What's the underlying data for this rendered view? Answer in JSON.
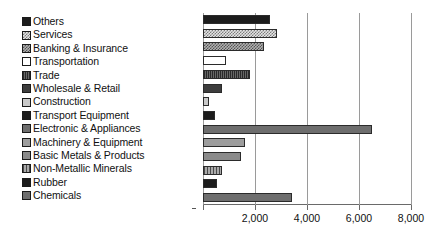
{
  "chart_data": {
    "type": "bar",
    "orientation": "horizontal",
    "title": "",
    "xlabel": "",
    "ylabel": "",
    "xlim": [
      0,
      8040
    ],
    "xticks": [
      2000,
      4000,
      6000,
      8000
    ],
    "xtick_labels": [
      "2,000",
      "4,000",
      "6,000",
      "8,000"
    ],
    "grid": true,
    "grid_axis": "x",
    "legend_position": "left-outside",
    "legend_order": "top-to-bottom matches bars top-to-bottom",
    "categories": [
      "Others",
      "Services",
      "Banking & Insurance",
      "Transportation",
      "Trade",
      "Wholesale & Retail",
      "Construction",
      "Transport Equipment",
      "Electronic & Appliances",
      "Machinery & Equipment",
      "Basic Metals & Products",
      "Non-Metallic Minerals",
      "Rubber",
      "Chemicals"
    ],
    "values": [
      2580,
      2850,
      2350,
      880,
      1810,
      730,
      230,
      460,
      6500,
      1615,
      1460,
      730,
      540,
      3420
    ],
    "bar_fills": [
      "solid-black",
      "check-light",
      "check-mid",
      "white",
      "hatch-dark",
      "solid-dark",
      "dot-light",
      "solid-black",
      "solid-mid",
      "dot-grey",
      "solid-grey",
      "vlines",
      "solid-black",
      "solid-mid"
    ]
  },
  "legend": {
    "items": [
      {
        "label": "Others",
        "swatch": "solid-black"
      },
      {
        "label": "Services",
        "swatch": "check-light"
      },
      {
        "label": "Banking & Insurance",
        "swatch": "check-mid"
      },
      {
        "label": "Transportation",
        "swatch": "white"
      },
      {
        "label": "Trade",
        "swatch": "hatch-dark"
      },
      {
        "label": "Wholesale & Retail",
        "swatch": "solid-dark"
      },
      {
        "label": "Construction",
        "swatch": "dot-light"
      },
      {
        "label": "Transport Equipment",
        "swatch": "solid-black"
      },
      {
        "label": "Electronic & Appliances",
        "swatch": "solid-mid"
      },
      {
        "label": "Machinery & Equipment",
        "swatch": "dot-grey"
      },
      {
        "label": "Basic Metals & Products",
        "swatch": "solid-grey"
      },
      {
        "label": "Non-Metallic Minerals",
        "swatch": "vlines"
      },
      {
        "label": "Rubber",
        "swatch": "solid-black"
      },
      {
        "label": "Chemicals",
        "swatch": "solid-mid"
      }
    ]
  },
  "colors": {
    "background": "#ffffff",
    "text": "#111111",
    "gridline": "#9a9a9a",
    "axis": "#6a6a6a",
    "bar_outline": "#2b2b2b"
  }
}
